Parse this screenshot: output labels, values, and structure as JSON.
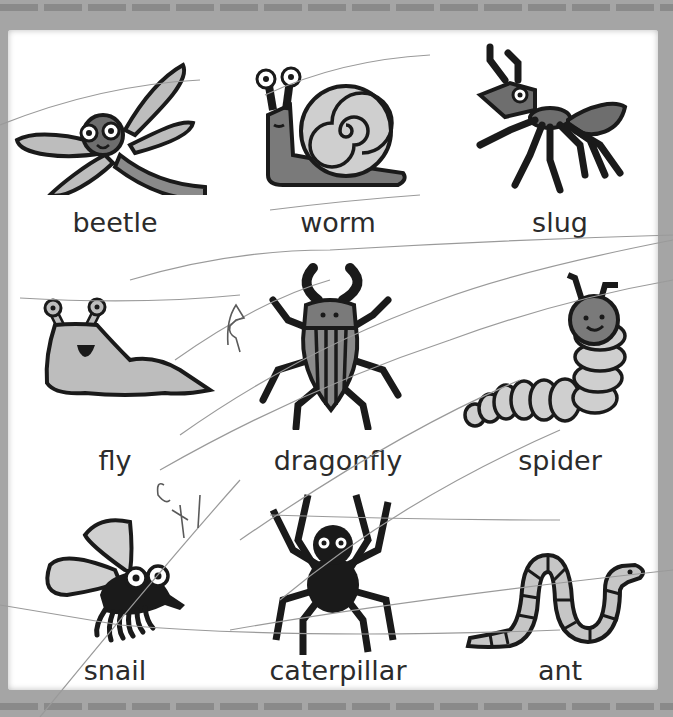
{
  "worksheet": {
    "title": "",
    "colors": {
      "border": "#a5a5a5",
      "paper": "#ffffff",
      "ink": "#1a1a1a",
      "fill_mid": "#7a7a7a",
      "fill_light": "#bdbdbd",
      "pencil": "#9a9a9a"
    },
    "grid": [
      {
        "row": 1,
        "col": 1,
        "picture": "dragonfly-icon",
        "label": "beetle"
      },
      {
        "row": 1,
        "col": 2,
        "picture": "snail-icon",
        "label": "worm"
      },
      {
        "row": 1,
        "col": 3,
        "picture": "ant-icon",
        "label": "slug"
      },
      {
        "row": 2,
        "col": 1,
        "picture": "slug-icon",
        "label": "fly"
      },
      {
        "row": 2,
        "col": 2,
        "picture": "beetle-icon",
        "label": "dragonfly"
      },
      {
        "row": 2,
        "col": 3,
        "picture": "caterpillar-icon",
        "label": "spider"
      },
      {
        "row": 3,
        "col": 1,
        "picture": "fly-icon",
        "label": "snail"
      },
      {
        "row": 3,
        "col": 2,
        "picture": "spider-icon",
        "label": "caterpillar"
      },
      {
        "row": 3,
        "col": 3,
        "picture": "worm-icon",
        "label": "ant"
      }
    ],
    "handwriting": [
      "A",
      "ታH"
    ]
  }
}
